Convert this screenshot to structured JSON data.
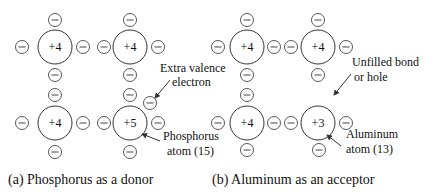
{
  "diagram": {
    "panels": [
      {
        "caption": "(a) Phosphorus as a donor",
        "atoms": [
          {
            "charge": "+4",
            "x": 55,
            "y": 47
          },
          {
            "charge": "+4",
            "x": 130,
            "y": 47
          },
          {
            "charge": "+4",
            "x": 55,
            "y": 123
          },
          {
            "charge": "+5",
            "x": 130,
            "y": 123
          }
        ],
        "annotations": [
          {
            "text_lines": [
              "Extra valence",
              "electron"
            ]
          },
          {
            "text_lines": [
              "Phosphorus",
              "atom (15)"
            ]
          }
        ]
      },
      {
        "caption": "(b) Aluminum as an acceptor",
        "atoms": [
          {
            "charge": "+4",
            "x": 247,
            "y": 47
          },
          {
            "charge": "+4",
            "x": 318,
            "y": 47
          },
          {
            "charge": "+4",
            "x": 247,
            "y": 123
          },
          {
            "charge": "+3",
            "x": 318,
            "y": 123
          }
        ],
        "annotations": [
          {
            "text_lines": [
              "Unfilled bond",
              "or hole"
            ]
          },
          {
            "text_lines": [
              "Aluminum",
              "atom (13)"
            ]
          }
        ]
      }
    ],
    "electron_symbol": "minus-in-circle"
  }
}
